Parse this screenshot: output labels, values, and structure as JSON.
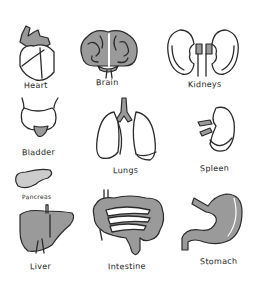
{
  "organs": {
    "heart": {
      "label": "Heart"
    },
    "brain": {
      "label": "Brain"
    },
    "kidneys": {
      "label": "Kidneys"
    },
    "bladder": {
      "label": "Bladder"
    },
    "lungs": {
      "label": "Lungs"
    },
    "spleen": {
      "label": "Spleen"
    },
    "pancreas": {
      "label": "Pancreas"
    },
    "liver": {
      "label": "Liver"
    },
    "intestine": {
      "label": "Intestine"
    },
    "stomach": {
      "label": "Stomach"
    }
  },
  "colors": {
    "ink": "#2a2a2a",
    "shade": "#9a9a9a",
    "background": "#ffffff"
  }
}
